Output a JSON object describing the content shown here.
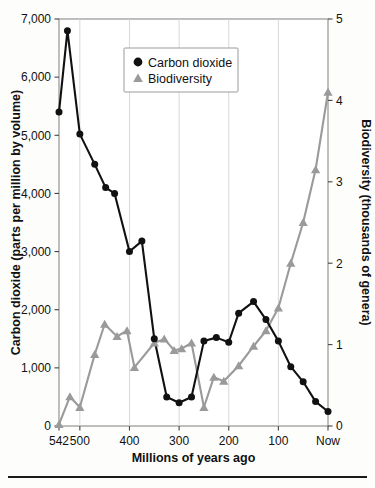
{
  "chart_data": {
    "type": "line",
    "title": "",
    "subtitle": "",
    "xlabel": "Millions of years ago",
    "ylabel": "Carbon dioxide (parts per million by volume)",
    "y2label": "Biodiversity (thousands of genera)",
    "xlim": [
      542,
      0
    ],
    "x_reversed": true,
    "ylim": [
      0,
      7000
    ],
    "y2lim": [
      0,
      5
    ],
    "grid": "vertical",
    "legend_position": "top-center",
    "x_ticks": [
      542,
      500,
      400,
      300,
      200,
      100,
      0
    ],
    "x_tick_labels": [
      "542",
      "500",
      "400",
      "300",
      "200",
      "100",
      "Now"
    ],
    "y_ticks": [
      0,
      1000,
      2000,
      3000,
      4000,
      5000,
      6000,
      7000
    ],
    "y_tick_labels": [
      "0",
      "1,000",
      "2,000",
      "3,000",
      "4,000",
      "5,000",
      "6,000",
      "7,000"
    ],
    "y2_ticks": [
      0,
      1,
      2,
      3,
      4,
      5
    ],
    "y2_tick_labels": [
      "0",
      "1",
      "2",
      "3",
      "4",
      "5"
    ],
    "series": [
      {
        "name": "Carbon dioxide",
        "axis": "left",
        "color": "#111111",
        "marker": "circle",
        "units": "ppm by volume",
        "points": [
          [
            542,
            5400
          ],
          [
            525,
            6800
          ],
          [
            500,
            5020
          ],
          [
            470,
            4500
          ],
          [
            448,
            4100
          ],
          [
            430,
            4000
          ],
          [
            400,
            3000
          ],
          [
            375,
            3180
          ],
          [
            350,
            1500
          ],
          [
            325,
            500
          ],
          [
            300,
            400
          ],
          [
            275,
            500
          ],
          [
            250,
            1460
          ],
          [
            225,
            1520
          ],
          [
            200,
            1440
          ],
          [
            180,
            1940
          ],
          [
            150,
            2140
          ],
          [
            125,
            1830
          ],
          [
            100,
            1460
          ],
          [
            75,
            1020
          ],
          [
            50,
            760
          ],
          [
            25,
            420
          ],
          [
            0,
            250
          ]
        ]
      },
      {
        "name": "Biodiversity",
        "axis": "right",
        "color": "#9a9a9a",
        "marker": "triangle",
        "units": "thousands of genera",
        "points": [
          [
            542,
            0.02
          ],
          [
            520,
            0.36
          ],
          [
            500,
            0.23
          ],
          [
            470,
            0.88
          ],
          [
            450,
            1.25
          ],
          [
            425,
            1.1
          ],
          [
            405,
            1.17
          ],
          [
            390,
            0.72
          ],
          [
            350,
            1.02
          ],
          [
            330,
            1.07
          ],
          [
            310,
            0.93
          ],
          [
            295,
            0.95
          ],
          [
            275,
            1.02
          ],
          [
            250,
            0.23
          ],
          [
            230,
            0.6
          ],
          [
            210,
            0.55
          ],
          [
            180,
            0.74
          ],
          [
            150,
            0.98
          ],
          [
            125,
            1.17
          ],
          [
            100,
            1.45
          ],
          [
            75,
            2.0
          ],
          [
            50,
            2.5
          ],
          [
            25,
            3.15
          ],
          [
            0,
            4.1
          ]
        ]
      }
    ],
    "legend": [
      {
        "label": "Carbon dioxide",
        "marker": "circle",
        "color": "#111111"
      },
      {
        "label": "Biodiversity",
        "marker": "triangle",
        "color": "#9a9a9a"
      }
    ]
  },
  "colors": {
    "co2": "#111111",
    "biodiversity": "#9a9a9a",
    "grid": "#d8d8d8",
    "frame": "#8a8a8a",
    "background": "#fdfdfb"
  }
}
